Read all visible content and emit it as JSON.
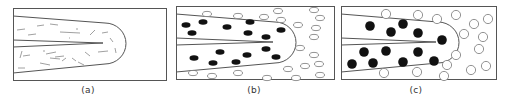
{
  "figure": {
    "panels": [
      {
        "id": "a",
        "label": "(a)",
        "label_x": 88,
        "box": [
          13,
          8,
          153,
          72
        ],
        "description": "tip region with short needle-like dashes",
        "tip": {
          "top_y_left": 16,
          "top_y_right": 23,
          "bot_y_left": 73,
          "bot_y_right": 64,
          "arc_cx": 105,
          "arc_r": 21,
          "center_y": 43
        },
        "crack": {
          "y1_left": 40,
          "y2_left": 47,
          "tip_x": 103
        },
        "dashes": [
          [
            17,
            30,
            25,
            29
          ],
          [
            37,
            26,
            44,
            25
          ],
          [
            50,
            24,
            58,
            25
          ],
          [
            28,
            35,
            36,
            34
          ],
          [
            60,
            32,
            80,
            33
          ],
          [
            90,
            35,
            95,
            30
          ],
          [
            102,
            33,
            108,
            32
          ],
          [
            110,
            38,
            113,
            42
          ],
          [
            76,
            29,
            78,
            29
          ],
          [
            69,
            38,
            70,
            38
          ],
          [
            20,
            58,
            22,
            51
          ],
          [
            23,
            56,
            30,
            55
          ],
          [
            46,
            54,
            56,
            52
          ],
          [
            55,
            57,
            64,
            56
          ],
          [
            40,
            63,
            50,
            65
          ],
          [
            50,
            58,
            60,
            59
          ],
          [
            62,
            61,
            66,
            58
          ],
          [
            72,
            58,
            76,
            61
          ],
          [
            85,
            52,
            90,
            56
          ],
          [
            98,
            52,
            108,
            51
          ],
          [
            115,
            48,
            116,
            53
          ],
          [
            18,
            68,
            25,
            68
          ],
          [
            78,
            62,
            84,
            65
          ],
          [
            43,
            51,
            45,
            51
          ]
        ]
      },
      {
        "id": "b",
        "label": "(b)",
        "label_x": 254,
        "box": [
          176,
          6,
          158,
          73
        ],
        "description": "filled ellipses inside tip, hollow ellipses outside",
        "tip": {
          "top_y_left": 14,
          "top_y_right": 22,
          "bot_y_left": 72,
          "bot_y_right": 63,
          "arc_cx": 275,
          "arc_r": 21,
          "center_y": 42
        },
        "crack": {
          "y1_left": 38,
          "y2_left": 45,
          "tip_x": 273
        },
        "filled": [
          [
            186,
            25
          ],
          [
            203,
            22
          ],
          [
            192,
            33
          ],
          [
            227,
            27
          ],
          [
            250,
            22
          ],
          [
            248,
            33
          ],
          [
            266,
            37
          ],
          [
            281,
            30
          ],
          [
            194,
            58
          ],
          [
            220,
            52
          ],
          [
            213,
            63
          ],
          [
            236,
            62
          ],
          [
            247,
            55
          ],
          [
            266,
            49
          ],
          [
            276,
            57
          ]
        ],
        "hollow": [
          [
            207,
            14
          ],
          [
            238,
            16
          ],
          [
            264,
            17
          ],
          [
            278,
            11
          ],
          [
            281,
            20
          ],
          [
            314,
            10
          ],
          [
            320,
            18
          ],
          [
            298,
            25
          ],
          [
            316,
            28
          ],
          [
            314,
            37
          ],
          [
            300,
            48
          ],
          [
            314,
            55
          ],
          [
            288,
            69
          ],
          [
            305,
            66
          ],
          [
            319,
            64
          ],
          [
            193,
            73
          ],
          [
            212,
            76
          ],
          [
            238,
            73
          ],
          [
            267,
            78
          ],
          [
            296,
            78
          ],
          [
            320,
            75
          ]
        ]
      },
      {
        "id": "c",
        "label": "(c)",
        "label_x": 416,
        "box": [
          341,
          6,
          155,
          73
        ],
        "description": "larger filled circles inside tip, hollow circles outside",
        "tip": {
          "top_y_left": 14,
          "top_y_right": 22,
          "bot_y_left": 72,
          "bot_y_right": 63,
          "arc_cx": 438,
          "arc_r": 21,
          "center_y": 42
        },
        "crack": {
          "y1_left": 38,
          "y2_left": 45,
          "tip_x": 436
        },
        "filled": [
          [
            370,
            26
          ],
          [
            391,
            32
          ],
          [
            403,
            24
          ],
          [
            418,
            33
          ],
          [
            442,
            40
          ],
          [
            364,
            52
          ],
          [
            386,
            51
          ],
          [
            418,
            52
          ],
          [
            352,
            64
          ],
          [
            373,
            63
          ],
          [
            403,
            62
          ],
          [
            434,
            61
          ]
        ],
        "hollow": [
          [
            386,
            14
          ],
          [
            418,
            15
          ],
          [
            437,
            19
          ],
          [
            456,
            15
          ],
          [
            474,
            24
          ],
          [
            488,
            19
          ],
          [
            464,
            34
          ],
          [
            483,
            37
          ],
          [
            479,
            49
          ],
          [
            456,
            55
          ],
          [
            447,
            65
          ],
          [
            471,
            70
          ],
          [
            486,
            66
          ],
          [
            384,
            73
          ],
          [
            417,
            72
          ],
          [
            444,
            76
          ]
        ]
      }
    ]
  }
}
